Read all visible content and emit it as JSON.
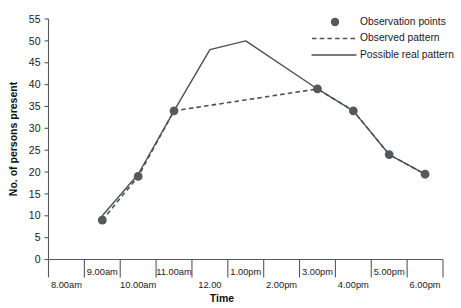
{
  "chart_data": {
    "type": "line",
    "title": "",
    "xlabel": "Time",
    "ylabel": "No. of persons present",
    "ylim": [
      0,
      55
    ],
    "yticks": [
      0,
      5,
      10,
      15,
      20,
      25,
      30,
      35,
      40,
      45,
      50,
      55
    ],
    "xtick_labels_upper": [
      "9.00am",
      "11.00am",
      "1.00pm",
      "3.00pm",
      "5.00pm"
    ],
    "xtick_labels_lower": [
      "8.00am",
      "10.00am",
      "12.00",
      "2.00pm",
      "4.00pm",
      "6.00pm"
    ],
    "x_categories": [
      "8.00am",
      "9.00am",
      "10.00am",
      "11.00am",
      "12.00",
      "1.00pm",
      "2.00pm",
      "3.00pm",
      "4.00pm",
      "5.00pm",
      "6.00pm"
    ],
    "grid": false,
    "legend_position": "top-right",
    "series": [
      {
        "name": "Observation points",
        "style": "markers",
        "x": [
          "9.00am",
          "10.00am",
          "11.00am",
          "3.00pm",
          "4.00pm",
          "5.00pm",
          "6.00pm"
        ],
        "values": [
          9,
          19,
          34,
          39,
          34,
          24,
          19.5
        ]
      },
      {
        "name": "Observed pattern",
        "style": "dashed",
        "x": [
          "9.00am",
          "10.00am",
          "11.00am",
          "3.00pm",
          "4.00pm",
          "5.00pm",
          "6.00pm"
        ],
        "values": [
          9,
          19,
          34,
          39,
          34,
          24,
          19.5
        ]
      },
      {
        "name": "Possible real pattern",
        "style": "solid",
        "x": [
          "9.00am",
          "10.00am",
          "11.00am",
          "12.00",
          "1.00pm",
          "3.00pm",
          "4.00pm",
          "5.00pm",
          "6.00pm"
        ],
        "values": [
          10,
          19.5,
          34,
          48,
          50,
          39,
          34,
          24,
          19.5
        ]
      }
    ]
  },
  "legend": {
    "items": [
      {
        "label": "Observation points",
        "marker": "dot"
      },
      {
        "label": "Observed pattern",
        "marker": "dashed-line"
      },
      {
        "label": "Possible real pattern",
        "marker": "solid-line"
      }
    ]
  },
  "colors": {
    "ink": "#1a1a1a",
    "line": "#55585c",
    "background": "#ffffff"
  }
}
